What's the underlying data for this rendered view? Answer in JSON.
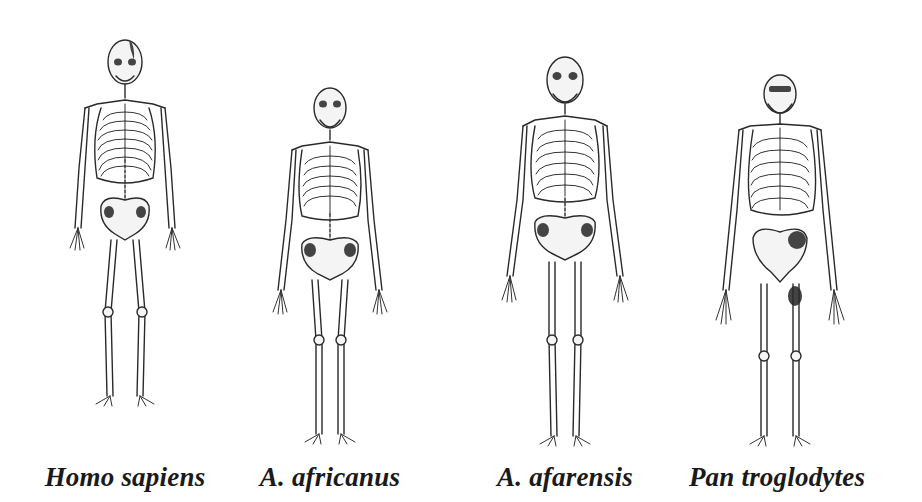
{
  "figure": {
    "type": "comparative anatomy illustration",
    "background": "#ffffff",
    "ink_color": "#1a1a1a",
    "panels": [
      {
        "id": "homo-sapiens",
        "label": "Homo sapiens",
        "center_x": 125,
        "top_y": 40,
        "feet_y": 445
      },
      {
        "id": "a-africanus",
        "label": "A. africanus",
        "center_x": 330,
        "top_y": 88,
        "feet_y": 448
      },
      {
        "id": "a-afarensis",
        "label": "A. afarensis",
        "center_x": 565,
        "top_y": 57,
        "feet_y": 450
      },
      {
        "id": "pan-troglodytes",
        "label": "Pan troglodytes",
        "center_x": 775,
        "top_y": 75,
        "feet_y": 452
      }
    ]
  }
}
